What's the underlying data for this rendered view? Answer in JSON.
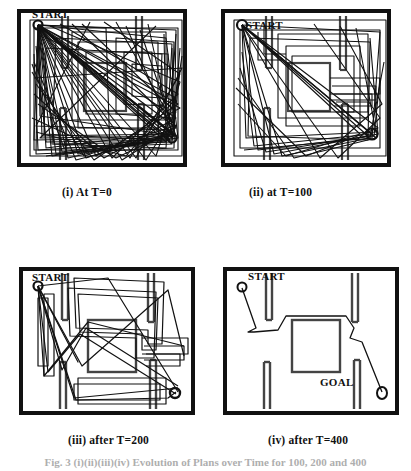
{
  "figure": {
    "title_partial": "Fig. 3 (i)(ii)(iii)(iv)  Evolution of Plans over Time for 100, 200 and 400",
    "panels": [
      {
        "id": "panel-t0",
        "caption": "(i) At T=0",
        "start_label": "START",
        "goal_label": "",
        "time": 0,
        "description": "Dense random plan bundle at T=0"
      },
      {
        "id": "panel-t100",
        "caption": "(ii) at T=100",
        "start_label": "START",
        "goal_label": "",
        "time": 100,
        "description": "Partially converged plan bundle at T=100"
      },
      {
        "id": "panel-t200",
        "caption": "(iii) after T=200",
        "start_label": "START",
        "goal_label": "",
        "time": 200,
        "description": "Few remaining plans after T=200"
      },
      {
        "id": "panel-t400",
        "caption": "(iv) after T=400",
        "start_label": "START",
        "goal_label": "GOAL",
        "time": 400,
        "description": "Single converged collision free plan after T=400"
      }
    ],
    "colors": {
      "ink": "#111111",
      "background": "#ffffff",
      "obstacle": "#3a3a3a",
      "path": "#1a1a1a"
    }
  }
}
